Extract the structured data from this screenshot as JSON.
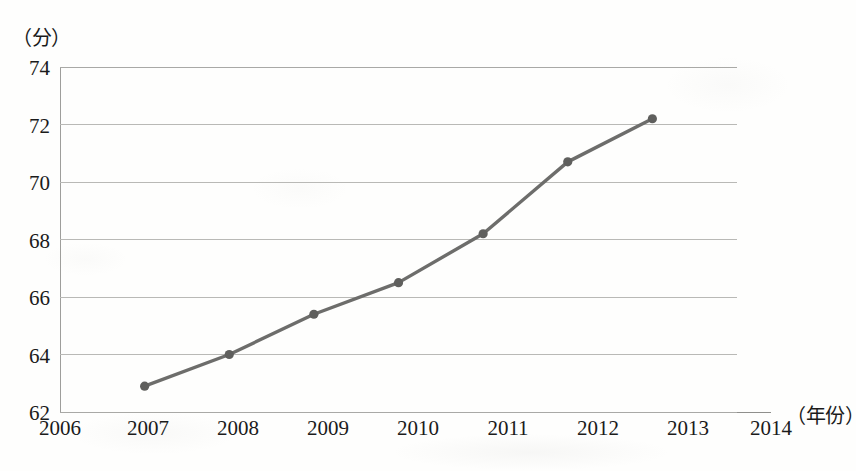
{
  "chart_data": {
    "type": "line",
    "title": "",
    "subtitle": "",
    "xlabel": "（年份）",
    "ylabel": "（分）",
    "x": [
      2007,
      2008,
      2009,
      2010,
      2011,
      2012,
      2013
    ],
    "values": [
      62.9,
      64.0,
      65.4,
      66.5,
      68.2,
      70.7,
      72.2
    ],
    "series": [
      {
        "name": "",
        "values": [
          62.9,
          64.0,
          65.4,
          66.5,
          68.2,
          70.7,
          72.2
        ]
      }
    ],
    "x_tick_labels": [
      "2006",
      "2007",
      "2008",
      "2009",
      "2010",
      "2011",
      "2012",
      "2013",
      "2014"
    ],
    "x_tick_values": [
      2006,
      2007,
      2008,
      2009,
      2010,
      2011,
      2012,
      2013,
      2014
    ],
    "y_tick_labels": [
      "62",
      "64",
      "66",
      "68",
      "70",
      "72",
      "74"
    ],
    "y_tick_values": [
      62,
      64,
      66,
      68,
      70,
      72,
      74
    ],
    "xlim": [
      2006,
      2014
    ],
    "ylim": [
      62,
      74
    ],
    "grid": "horizontal",
    "legend": "none",
    "marker": "circle",
    "line_color": "#6d6d6b",
    "marker_color": "#5f5f5d",
    "grid_color": "#b9b9b6",
    "axis_color": "#8f8f8c",
    "background_color": "#fefefd",
    "text_color": "#1b1b1b"
  }
}
